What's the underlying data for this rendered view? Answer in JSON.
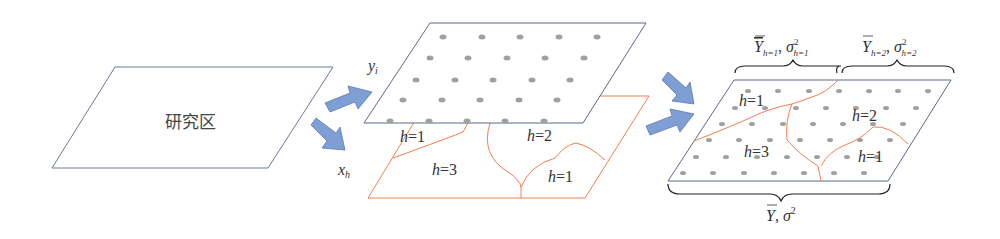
{
  "diagram": {
    "study_area": {
      "label": "研究区",
      "border_color": "#6a7a9a"
    },
    "arrows": {
      "color": "#7f9fd4",
      "stroke": "#5a7ab4"
    },
    "sample_layer": {
      "label_var": "y",
      "label_sub": "i",
      "border_color": "#5a6a8a",
      "dot_color": "#a0a0a0"
    },
    "strata_layer": {
      "label_var": "x",
      "label_sub": "h",
      "border_color": "#f08050",
      "strata_labels": [
        {
          "h": "h",
          "eq": "=1"
        },
        {
          "h": "h",
          "eq": "=2"
        },
        {
          "h": "h",
          "eq": "=3"
        },
        {
          "h": "h",
          "eq": "=1"
        }
      ]
    },
    "result_layer": {
      "border_color": "#5a6a8a",
      "boundary_color": "#f08050",
      "strata_labels": [
        {
          "h": "h",
          "eq": "=1"
        },
        {
          "h": "h",
          "eq": "=2"
        },
        {
          "h": "h",
          "eq": "=3"
        },
        {
          "h": "h",
          "eq": "=1"
        }
      ],
      "brace_top_left": {
        "mean": "Y",
        "mean_sub": "h=1",
        "sep": ", ",
        "var": "σ",
        "var_sup": "2",
        "var_sub": "h=1"
      },
      "brace_top_right": {
        "mean": "Y",
        "mean_sub": "h=2",
        "sep": ", ",
        "var": "σ",
        "var_sup": "2",
        "var_sub": "h=2"
      },
      "brace_bottom": {
        "mean": "Y",
        "sep": ", ",
        "var": "σ",
        "var_sup": "2"
      }
    }
  }
}
